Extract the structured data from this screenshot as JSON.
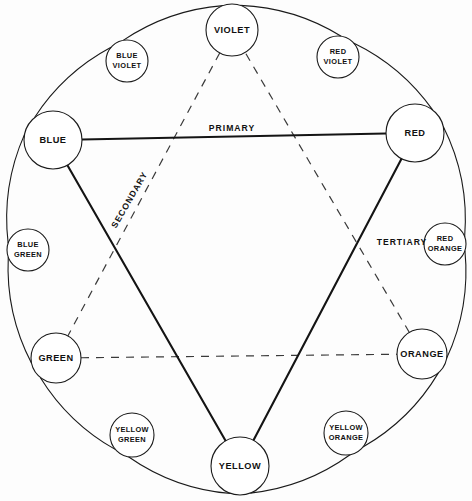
{
  "diagram": {
    "background_color": "#fdfdfd",
    "line_color": "#1a1a1a"
  },
  "legend": {
    "primary": "PRIMARY",
    "secondary": "SECONDARY",
    "tertiary": "TERTIARY"
  },
  "nodes": [
    {
      "id": "violet",
      "line1": "VIOLET",
      "line2": "",
      "cx": 232,
      "cy": 30,
      "r": 26,
      "category": "secondary"
    },
    {
      "id": "red-violet",
      "line1": "RED",
      "line2": "VIOLET",
      "cx": 338,
      "cy": 57,
      "r": 21,
      "category": "tertiary"
    },
    {
      "id": "red",
      "line1": "RED",
      "line2": "",
      "cx": 415,
      "cy": 133,
      "r": 29,
      "category": "primary"
    },
    {
      "id": "red-orange",
      "line1": "RED",
      "line2": "ORANGE",
      "cx": 445,
      "cy": 244,
      "r": 21,
      "category": "tertiary"
    },
    {
      "id": "orange",
      "line1": "ORANGE",
      "line2": "",
      "cx": 422,
      "cy": 354,
      "r": 25,
      "category": "secondary"
    },
    {
      "id": "yellow-orange",
      "line1": "YELLOW",
      "line2": "ORANGE",
      "cx": 346,
      "cy": 433,
      "r": 22,
      "category": "tertiary"
    },
    {
      "id": "yellow",
      "line1": "YELLOW",
      "line2": "",
      "cx": 240,
      "cy": 466,
      "r": 29,
      "category": "primary"
    },
    {
      "id": "yellow-green",
      "line1": "YELLOW",
      "line2": "GREEN",
      "cx": 132,
      "cy": 435,
      "r": 22,
      "category": "tertiary"
    },
    {
      "id": "green",
      "line1": "GREEN",
      "line2": "",
      "cx": 56,
      "cy": 358,
      "r": 25,
      "category": "secondary"
    },
    {
      "id": "blue-green",
      "line1": "BLUE",
      "line2": "GREEN",
      "cx": 28,
      "cy": 250,
      "r": 21,
      "category": "tertiary"
    },
    {
      "id": "blue",
      "line1": "BLUE",
      "line2": "",
      "cx": 53,
      "cy": 140,
      "r": 29,
      "category": "primary"
    },
    {
      "id": "blue-violet",
      "line1": "BLUE",
      "line2": "VIOLET",
      "cx": 127,
      "cy": 61,
      "r": 21,
      "category": "tertiary"
    }
  ],
  "primary_triangle": {
    "style": "solid",
    "label": "PRIMARY",
    "vertices": [
      "blue",
      "red",
      "yellow"
    ],
    "label_x": 232,
    "label_y": 129
  },
  "secondary_triangle": {
    "style": "dashed",
    "label": "SECONDARY",
    "vertices": [
      "violet",
      "green",
      "orange"
    ],
    "label_x": 130,
    "label_y": 200,
    "label_rotation": -60
  },
  "tertiary_note": {
    "label": "TERTIARY",
    "label_x": 402,
    "label_y": 243
  },
  "wheel": {
    "center_x": 235,
    "center_y": 248,
    "radius": 208
  }
}
